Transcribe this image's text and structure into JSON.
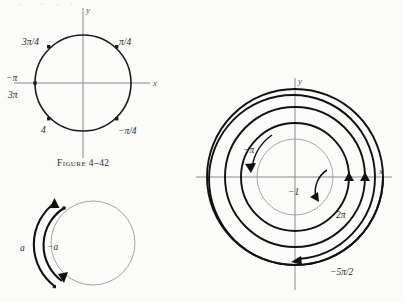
{
  "page": {
    "width": 403,
    "height": 302,
    "background": "#fbfbfa",
    "ink": "#1a1a1a",
    "axis_color": "#8a8a8a"
  },
  "caption": {
    "text": "Figure 4–42"
  },
  "figures": [
    {
      "id": "unit-circle-angles",
      "name": "unit-circle-with-eighth-turn-angles",
      "axis_labels": {
        "x": "x",
        "y": "y"
      },
      "center": {
        "x": 83,
        "y": 83
      },
      "radius": 48,
      "points": [
        {
          "label": "3π/4",
          "angle_deg": 135,
          "label_x": 22,
          "label_y": 42
        },
        {
          "label": "π/4",
          "angle_deg": 45,
          "label_x": 119,
          "label_y": 42
        },
        {
          "label": "−π",
          "angle_deg": 180,
          "label_x": 6,
          "label_y": 78
        },
        {
          "label": "3π",
          "angle_deg": 180,
          "label_x": 8,
          "label_y": 95
        },
        {
          "label": "4",
          "angle_deg": 225,
          "label_x": 41,
          "label_y": 130
        },
        {
          "label": "−π/4",
          "angle_deg": 315,
          "label_x": 118,
          "label_y": 131
        }
      ]
    },
    {
      "id": "arc-a-minus-a",
      "name": "circle-with-opposite-arcs",
      "center": {
        "x": 93,
        "y": 243
      },
      "radius": 42,
      "arcs": [
        {
          "label": "a",
          "direction": "counterclockwise",
          "label_x": 20,
          "label_y": 248
        },
        {
          "label": "−a",
          "direction": "clockwise",
          "label_x": 48,
          "label_y": 247
        }
      ]
    },
    {
      "id": "spiral-winding",
      "name": "concentric-circles-winding-number-diagram",
      "axis_labels": {
        "x": "x",
        "y": "y"
      },
      "center": {
        "x": 295,
        "y": 177
      },
      "labels": [
        {
          "text": "−π",
          "x": 243,
          "y": 150
        },
        {
          "text": "−1",
          "x": 290,
          "y": 192
        },
        {
          "text": "2π",
          "x": 337,
          "y": 215
        },
        {
          "text": "−5π/2",
          "x": 331,
          "y": 272
        }
      ],
      "circle_radii": [
        38,
        54,
        70,
        88
      ],
      "turns": [
        "−π",
        "−1",
        "2π",
        "−5π/2"
      ]
    }
  ]
}
